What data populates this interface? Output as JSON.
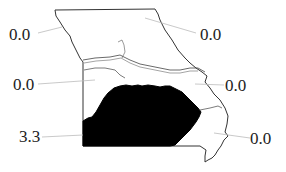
{
  "map": {
    "region": "Missouri",
    "highlight_color": "#000000",
    "outline_color": "#333333",
    "leader_color": "#bbbbbb",
    "regions": [
      {
        "name": "northwest",
        "value": "0.0"
      },
      {
        "name": "northeast",
        "value": "0.0"
      },
      {
        "name": "west-central",
        "value": "0.0"
      },
      {
        "name": "east-central",
        "value": "0.0"
      },
      {
        "name": "southwest",
        "value": "3.3",
        "highlighted": true
      },
      {
        "name": "southeast",
        "value": "0.0"
      }
    ]
  }
}
